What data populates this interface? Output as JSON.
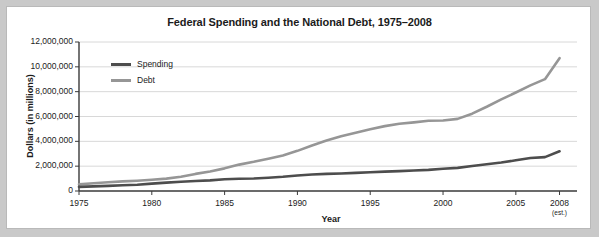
{
  "figure": {
    "title": "Federal Spending and the National Debt, 1975–2008",
    "background_color": "#c9c9c9",
    "card_color": "#ffffff",
    "border_color": "#b9b9b9"
  },
  "chart_data": {
    "type": "line",
    "title": "Federal Spending and the National Debt, 1975–2008",
    "xlabel": "Year",
    "ylabel": "Dollars (in millions)",
    "xlim": [
      1975,
      2009.2
    ],
    "ylim": [
      0,
      12000000
    ],
    "grid": true,
    "grid_axis": "y",
    "legend_position": "top-left-inside",
    "x_tick_labels": [
      "1975",
      "1980",
      "1985",
      "1990",
      "1995",
      "2000",
      "2005",
      "2008"
    ],
    "x_tick_values": [
      1975,
      1980,
      1985,
      1990,
      1995,
      2000,
      2005,
      2008
    ],
    "x_tick_sublabels": [
      "",
      "",
      "",
      "",
      "",
      "",
      "",
      "(est.)"
    ],
    "y_tick_labels": [
      "0",
      "2,000,000",
      "4,000,000",
      "6,000,000",
      "8,000,000",
      "10,000,000",
      "12,000,000"
    ],
    "y_tick_values": [
      0,
      2000000,
      4000000,
      6000000,
      8000000,
      10000000,
      12000000
    ],
    "x": [
      1975,
      1976,
      1977,
      1978,
      1979,
      1980,
      1981,
      1982,
      1983,
      1984,
      1985,
      1986,
      1987,
      1988,
      1989,
      1990,
      1991,
      1992,
      1993,
      1994,
      1995,
      1996,
      1997,
      1998,
      1999,
      2000,
      2001,
      2002,
      2003,
      2004,
      2005,
      2006,
      2007,
      2008
    ],
    "series": [
      {
        "name": "Spending",
        "color": "#4d4d4d",
        "line_width": 2.6,
        "values": [
          332000,
          372000,
          409000,
          459000,
          504000,
          591000,
          678000,
          746000,
          808000,
          852000,
          946000,
          990000,
          1004000,
          1064000,
          1143000,
          1253000,
          1324000,
          1382000,
          1409000,
          1462000,
          1516000,
          1561000,
          1601000,
          1653000,
          1702000,
          1789000,
          1863000,
          2011000,
          2160000,
          2293000,
          2472000,
          2655000,
          2729000,
          3200000
        ]
      },
      {
        "name": "Debt",
        "color": "#969696",
        "line_width": 2.6,
        "values": [
          533000,
          620000,
          699000,
          772000,
          827000,
          908000,
          998000,
          1142000,
          1377000,
          1572000,
          1823000,
          2125000,
          2350000,
          2602000,
          2857000,
          3233000,
          3665000,
          4065000,
          4411000,
          4693000,
          4974000,
          5225000,
          5413000,
          5526000,
          5656000,
          5674000,
          5807000,
          6228000,
          6783000,
          7379000,
          7933000,
          8507000,
          9008000,
          10700000
        ]
      }
    ]
  }
}
